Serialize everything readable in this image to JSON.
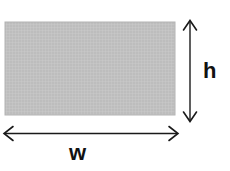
{
  "diagram": {
    "type": "rectangle-dimensions",
    "background_color": "#ffffff",
    "shape": {
      "name": "rectangle",
      "fill_color": "#bdbdbd",
      "texture": "fine-crosshatch-grid",
      "texture_line_color": "#cfcfcf",
      "border_color": "#b0b0b0",
      "x": 5,
      "y": 22,
      "width": 170,
      "height": 93
    },
    "annotations": {
      "height_arrow": {
        "label": "h",
        "orientation": "vertical",
        "style": "double-headed",
        "color": "#1a1a1a",
        "x": 190,
        "y_start": 20,
        "y_end": 122,
        "label_x": 210,
        "label_y": 71
      },
      "width_arrow": {
        "label": "w",
        "orientation": "horizontal",
        "style": "double-headed",
        "color": "#1a1a1a",
        "y": 133,
        "x_start": 4,
        "x_end": 178,
        "label_x": 80,
        "label_y": 152
      }
    }
  }
}
